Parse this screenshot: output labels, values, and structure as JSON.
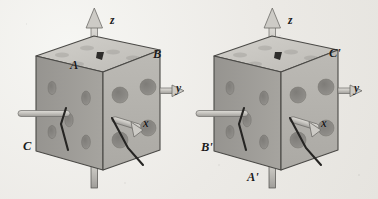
{
  "figure": {
    "background_color": "#ece9e4",
    "cube_face_colors": {
      "top": "#c9c7c2",
      "front": "#b5b3ae",
      "left": "#9d9b97",
      "hole": "#8e8c88",
      "edge": "#4a4946"
    },
    "axis_arrow_color": "#c4c2be",
    "axis_arrow_outline": "#6b6a66",
    "rod_color": "#c9c7c2",
    "pointer_color": "#2b2a28"
  },
  "left_cube": {
    "name": "cube-unprimed",
    "axes": [
      {
        "id": "z",
        "label": "z",
        "direction": "up"
      },
      {
        "id": "y",
        "label": "y",
        "direction": "right"
      },
      {
        "id": "x",
        "label": "x",
        "direction": "toward-viewer"
      }
    ],
    "vertex_labels": [
      {
        "id": "A",
        "label": "A",
        "position": "top-front-left"
      },
      {
        "id": "B",
        "label": "B",
        "position": "top-back-right"
      },
      {
        "id": "C",
        "label": "C",
        "position": "bottom-front-left"
      }
    ]
  },
  "right_cube": {
    "name": "cube-primed",
    "axes": [
      {
        "id": "z",
        "label": "z",
        "direction": "up"
      },
      {
        "id": "y",
        "label": "y",
        "direction": "right"
      },
      {
        "id": "x",
        "label": "x",
        "direction": "toward-viewer"
      }
    ],
    "vertex_labels": [
      {
        "id": "Cp",
        "label": "C'",
        "position": "top-back-right"
      },
      {
        "id": "Bp",
        "label": "B'",
        "position": "bottom-front-left"
      },
      {
        "id": "Ap",
        "label": "A'",
        "position": "bottom-front-center"
      }
    ]
  }
}
